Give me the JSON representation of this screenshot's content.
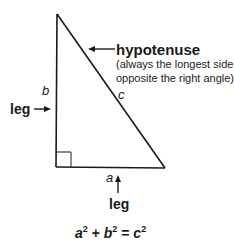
{
  "diagram": {
    "type": "right-triangle",
    "vertices": {
      "top": [
        58,
        14
      ],
      "bottom_left": [
        56,
        167
      ],
      "bottom_right": [
        165,
        168
      ]
    },
    "right_angle_marker": "square at bottom-left corner",
    "side_labels": {
      "a": "a",
      "b": "b",
      "c": "c"
    },
    "callouts": {
      "hypotenuse": {
        "label": "hypotenuse",
        "note_line1": "(always the longest side;",
        "note_line2": "opposite the right angle)"
      },
      "left_leg": {
        "label": "leg"
      },
      "bottom_leg": {
        "label": "leg"
      }
    },
    "equation": {
      "a": "a",
      "b": "b",
      "c": "c",
      "exponent": "2",
      "plus": "+",
      "equals": "="
    },
    "colors": {
      "line": "#1a1a1a",
      "background": "#ffffff"
    }
  }
}
